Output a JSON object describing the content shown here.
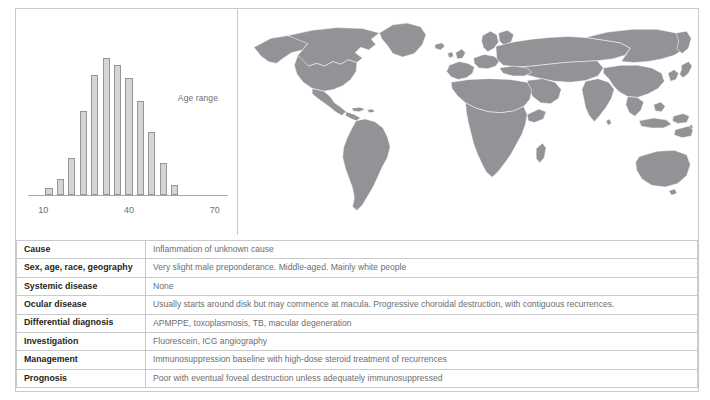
{
  "figure": {
    "panels": {
      "chart_label": "Age range",
      "map_label": "world-map"
    }
  },
  "chart_data": {
    "type": "bar",
    "title": "Age range",
    "xlabel": "",
    "ylabel": "",
    "xlim": [
      5,
      75
    ],
    "ylim": [
      0,
      100
    ],
    "grid": false,
    "legend": "none",
    "annotations": [
      "Age range"
    ],
    "tick_labels": [
      "10",
      "40",
      "70"
    ],
    "ticks": [
      10,
      40,
      70
    ],
    "categories": [
      12,
      16,
      20,
      24,
      28,
      32,
      36,
      40,
      44,
      48,
      52,
      56,
      60
    ],
    "values": [
      5,
      11,
      26,
      58,
      83,
      95,
      90,
      81,
      65,
      44,
      22,
      7,
      0
    ],
    "bar_fill": "#d4d5d6",
    "bar_stroke": "#939598",
    "axis_color": "#a7a9ac"
  },
  "table": {
    "rows": [
      {
        "label": "Cause",
        "value": "Inflammation of unknown cause"
      },
      {
        "label": "Sex, age, race, geography",
        "value": "Very slight male preponderance. Middle-aged. Mainly white people"
      },
      {
        "label": "Systemic disease",
        "value": "None"
      },
      {
        "label": "Ocular disease",
        "value": "Usually starts around disk but may commence at macula. Progressive choroidal destruction, with contiguous recurrences."
      },
      {
        "label": "Differential diagnosis",
        "value": "APMPPE, toxoplasmosis, TB, macular degeneration"
      },
      {
        "label": "Investigation",
        "value": "Fluorescein, ICG angiography"
      },
      {
        "label": "Management",
        "value": "Immunosuppression baseline with high-dose steroid treatment of recurrences"
      },
      {
        "label": "Prognosis",
        "value": "Poor with eventual foveal destruction unless adequately immunosuppressed"
      }
    ]
  },
  "colors": {
    "border": "#c9cacc",
    "map_land": "#919396",
    "map_border": "#ffffff",
    "text_label": "#231f20",
    "text_value": "#6d6e71"
  }
}
